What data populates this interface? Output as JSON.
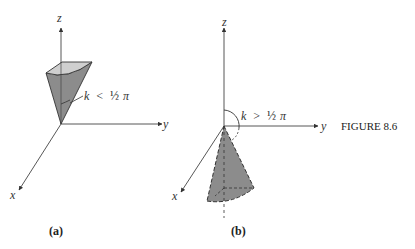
{
  "figure": {
    "label": "FIGURE 8.6",
    "panels": [
      {
        "id": "a",
        "caption": "(a)",
        "axes": {
          "x": "x",
          "y": "y",
          "z": "z"
        },
        "annotation_k": "k",
        "annotation_rel": "<",
        "annotation_frac": "½",
        "annotation_pi": "π",
        "description": "Narrow cone opening upward about the z-axis, half-angle k less than pi/2"
      },
      {
        "id": "b",
        "caption": "(b)",
        "axes": {
          "x": "x",
          "y": "y",
          "z": "z"
        },
        "annotation_k": "k",
        "annotation_rel": ">",
        "annotation_frac": "½",
        "annotation_pi": "π",
        "description": "Cone opening downward below the xy-plane, angle k greater than pi/2 measured from positive z-axis"
      }
    ]
  },
  "colors": {
    "fill": "#8c8c8c",
    "fill_light": "#c8c8c8",
    "stroke": "#333333"
  }
}
